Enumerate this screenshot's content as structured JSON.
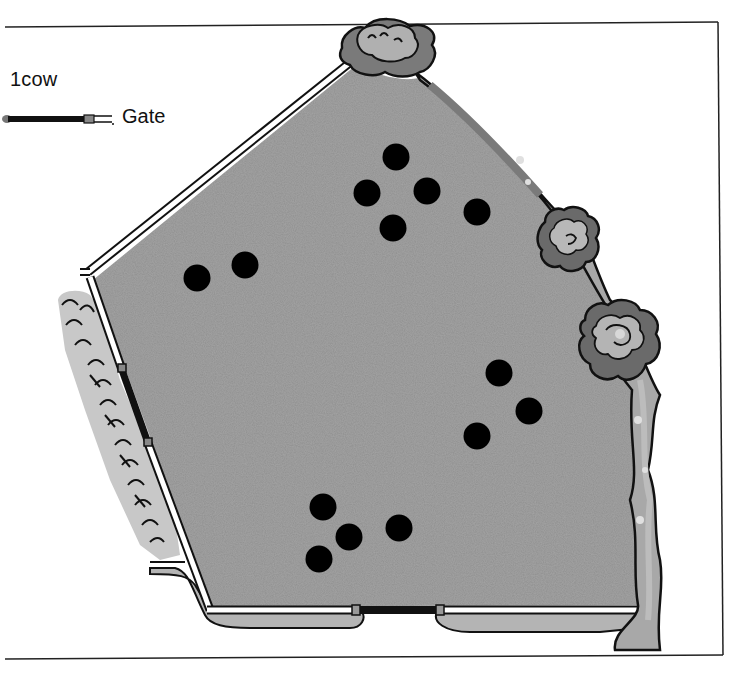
{
  "legend": {
    "cow_label": "1cow",
    "gate_label": "Gate"
  },
  "colors": {
    "field": "#8f8f8f",
    "field_light": "#a5a5a5",
    "hedge_light": "#b8b8b8",
    "hedge_dark": "#6f6f6f",
    "path": "#b4b4b4",
    "outline": "#111111",
    "cow": "#000000",
    "fence": "#ffffff"
  },
  "field": {
    "description": "Pentagonal field enclosed by fence and hedge",
    "gates": [
      {
        "id": "left-gate",
        "location": "left fence"
      },
      {
        "id": "bottom-gate",
        "location": "bottom fence"
      }
    ]
  },
  "cows": [
    {
      "x": 396,
      "y": 157
    },
    {
      "x": 367,
      "y": 193
    },
    {
      "x": 427,
      "y": 191
    },
    {
      "x": 393,
      "y": 228
    },
    {
      "x": 477,
      "y": 212
    },
    {
      "x": 197,
      "y": 278
    },
    {
      "x": 245,
      "y": 265
    },
    {
      "x": 499,
      "y": 373
    },
    {
      "x": 529,
      "y": 411
    },
    {
      "x": 477,
      "y": 436
    },
    {
      "x": 323,
      "y": 507
    },
    {
      "x": 349,
      "y": 537
    },
    {
      "x": 319,
      "y": 559
    },
    {
      "x": 399,
      "y": 528
    }
  ],
  "cow_count": 14
}
